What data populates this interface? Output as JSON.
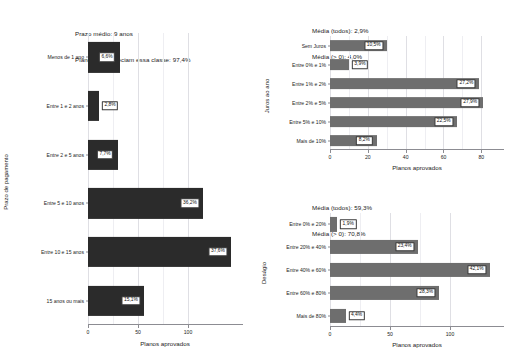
{
  "figure": {
    "background": "#ffffff",
    "width": 518,
    "height": 362
  },
  "chart_data": [
    {
      "id": "prazo-pagamento",
      "type": "bar",
      "orientation": "horizontal",
      "title": "Prazo médio: 9 anos\nPlanos que apreciam essa classe: 97,4%",
      "title_lines": [
        "Prazo médio: 9 anos",
        "Planos que apreciam essa classe: 97,4%"
      ],
      "xlabel": "Planos aprovados",
      "ylabel": "Prazo de pagamento",
      "bar_color": "#2b2b2b",
      "grid": true,
      "legend": "none",
      "xlim": [
        0,
        155
      ],
      "xticks": [
        0,
        50,
        100
      ],
      "xticklabels": [
        "0",
        "50",
        "100"
      ],
      "categories": [
        "Menos de 1 ano",
        "Entre 1 e 2 anos",
        "Entre 2 e 5 anos",
        "Entre 5 e 10 anos",
        "Entre 10 e 15 anos",
        "15 anos ou mais"
      ],
      "values": [
        32,
        11,
        30,
        115,
        143,
        56
      ],
      "data_labels": [
        "6,6%",
        "2,8%",
        "7,7%",
        "36,2%",
        "37,6%",
        "15,1%"
      ]
    },
    {
      "id": "juros-ao-ano",
      "type": "bar",
      "orientation": "horizontal",
      "title": "Média (todos): 2,9%\nMédia (> 0): 4,0%",
      "title_lines": [
        "Média (todos): 2,9%",
        "Média (> 0): 4,0%"
      ],
      "xlabel": "Planos aprovados",
      "ylabel": "Juros ao ano",
      "bar_color": "#6e6e6e",
      "grid": true,
      "legend": "none",
      "xlim": [
        0,
        92
      ],
      "xticks": [
        0,
        20,
        40,
        60,
        80
      ],
      "xticklabels": [
        "0",
        "20",
        "40",
        "60",
        "80"
      ],
      "categories": [
        "Sem Juros",
        "Entre 0% e 1%",
        "Entre 1% e 2%",
        "Entre 2% e 5%",
        "Entre 5% e 10%",
        "Mais de 10%"
      ],
      "values": [
        30,
        10,
        79,
        81,
        67,
        25
      ],
      "data_labels": [
        "10,5%",
        "3,9%",
        "27,2%",
        "27,9%",
        "22,5%",
        "8,2%"
      ]
    },
    {
      "id": "desagio",
      "type": "bar",
      "orientation": "horizontal",
      "title": "Média (todos): 59,3%\nMédia (> 0): 70,8%",
      "title_lines": [
        "Média (todos): 59,3%",
        "Média (> 0): 70,8%"
      ],
      "xlabel": "Planos aprovados",
      "ylabel": "Deságio",
      "bar_color": "#6e6e6e",
      "grid": true,
      "legend": "none",
      "xlim": [
        0,
        145
      ],
      "xticks": [
        0,
        50,
        100
      ],
      "xticklabels": [
        "0",
        "50",
        "100"
      ],
      "categories": [
        "Entre 0% e 20%",
        "Entre 20% e 40%",
        "Entre 40% e 60%",
        "Entre 60% e 80%",
        "Mais de 80%"
      ],
      "values": [
        6,
        73,
        133,
        91,
        13
      ],
      "data_labels": [
        "1,9%",
        "23,4%",
        "42,1%",
        "28,3%",
        "4,4%"
      ]
    }
  ]
}
